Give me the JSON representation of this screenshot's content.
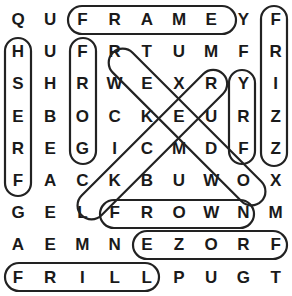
{
  "puzzle": {
    "rows": [
      [
        "Q",
        "U",
        "F",
        "R",
        "A",
        "M",
        "E",
        "Y",
        "F"
      ],
      [
        "H",
        "U",
        "F",
        "R",
        "T",
        "U",
        "M",
        "F",
        "R"
      ],
      [
        "S",
        "H",
        "R",
        "W",
        "E",
        "X",
        "R",
        "Y",
        "I"
      ],
      [
        "E",
        "B",
        "O",
        "C",
        "K",
        "E",
        "U",
        "R",
        "Z"
      ],
      [
        "R",
        "E",
        "G",
        "I",
        "C",
        "M",
        "D",
        "F",
        "Z"
      ],
      [
        "F",
        "A",
        "C",
        "K",
        "B",
        "U",
        "W",
        "O",
        "X"
      ],
      [
        "G",
        "E",
        "L",
        "F",
        "R",
        "O",
        "W",
        "N",
        "M"
      ],
      [
        "A",
        "E",
        "M",
        "N",
        "E",
        "Z",
        "O",
        "R",
        "F"
      ],
      [
        "F",
        "R",
        "I",
        "L",
        "L",
        "P",
        "U",
        "G",
        "T"
      ]
    ],
    "found_words": [
      {
        "word": "FRAME",
        "start": [
          0,
          2
        ],
        "end": [
          0,
          6
        ]
      },
      {
        "word": "FRIZZ",
        "start": [
          0,
          8
        ],
        "end": [
          4,
          8
        ]
      },
      {
        "word": "HSERF",
        "start": [
          1,
          0
        ],
        "end": [
          5,
          0
        ]
      },
      {
        "word": "FROG",
        "start": [
          1,
          2
        ],
        "end": [
          4,
          2
        ]
      },
      {
        "word": "YRF",
        "start": [
          2,
          7
        ],
        "end": [
          4,
          7
        ]
      },
      {
        "word": "FROWN",
        "start": [
          6,
          3
        ],
        "end": [
          6,
          7
        ]
      },
      {
        "word": "EZORF",
        "start": [
          7,
          4
        ],
        "end": [
          7,
          8
        ]
      },
      {
        "word": "FRILL",
        "start": [
          8,
          0
        ],
        "end": [
          8,
          4
        ]
      },
      {
        "word": "FREEZE",
        "start": [
          1,
          7
        ],
        "end": [
          7,
          1
        ]
      },
      {
        "word": "F-diagonal-M",
        "start": [
          0,
          2
        ],
        "end": [
          6,
          8
        ]
      }
    ]
  }
}
